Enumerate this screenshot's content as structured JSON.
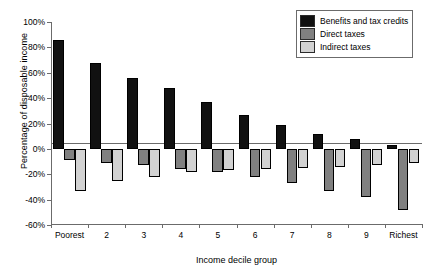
{
  "chart_data": {
    "type": "bar",
    "title": "",
    "xlabel": "Income decile group",
    "ylabel": "Percentage of disposable income",
    "categories": [
      "Poorest",
      "2",
      "3",
      "4",
      "5",
      "6",
      "7",
      "8",
      "9",
      "Richest"
    ],
    "series": [
      {
        "name": "Benefits and tax credits",
        "color": "#111111",
        "values": [
          86,
          68,
          56,
          48,
          37,
          27,
          19,
          12,
          8,
          3
        ]
      },
      {
        "name": "Direct taxes",
        "color": "#808080",
        "values": [
          -9,
          -11,
          -13,
          -16,
          -18,
          -22,
          -27,
          -33,
          -38,
          -48
        ]
      },
      {
        "name": "Indirect taxes",
        "color": "#d2d2d2",
        "values": [
          -33,
          -25,
          -22,
          -18,
          -17,
          -16,
          -15,
          -14,
          -13,
          -11
        ]
      }
    ],
    "ylim": [
      -60,
      100
    ],
    "ytick_values": [
      100,
      80,
      60,
      40,
      20,
      0,
      -20,
      -40,
      -60
    ],
    "ytick_labels": [
      "100%",
      "80%",
      "60%",
      "40%",
      "20%",
      "0%",
      "-20%",
      "-40%",
      "-60%"
    ],
    "grid": false,
    "legend_position": "top-right"
  },
  "legend": {
    "items": [
      {
        "label": "Benefits and tax credits",
        "color": "#111111"
      },
      {
        "label": "Direct taxes",
        "color": "#808080"
      },
      {
        "label": "Indirect taxes",
        "color": "#d2d2d2"
      }
    ]
  }
}
